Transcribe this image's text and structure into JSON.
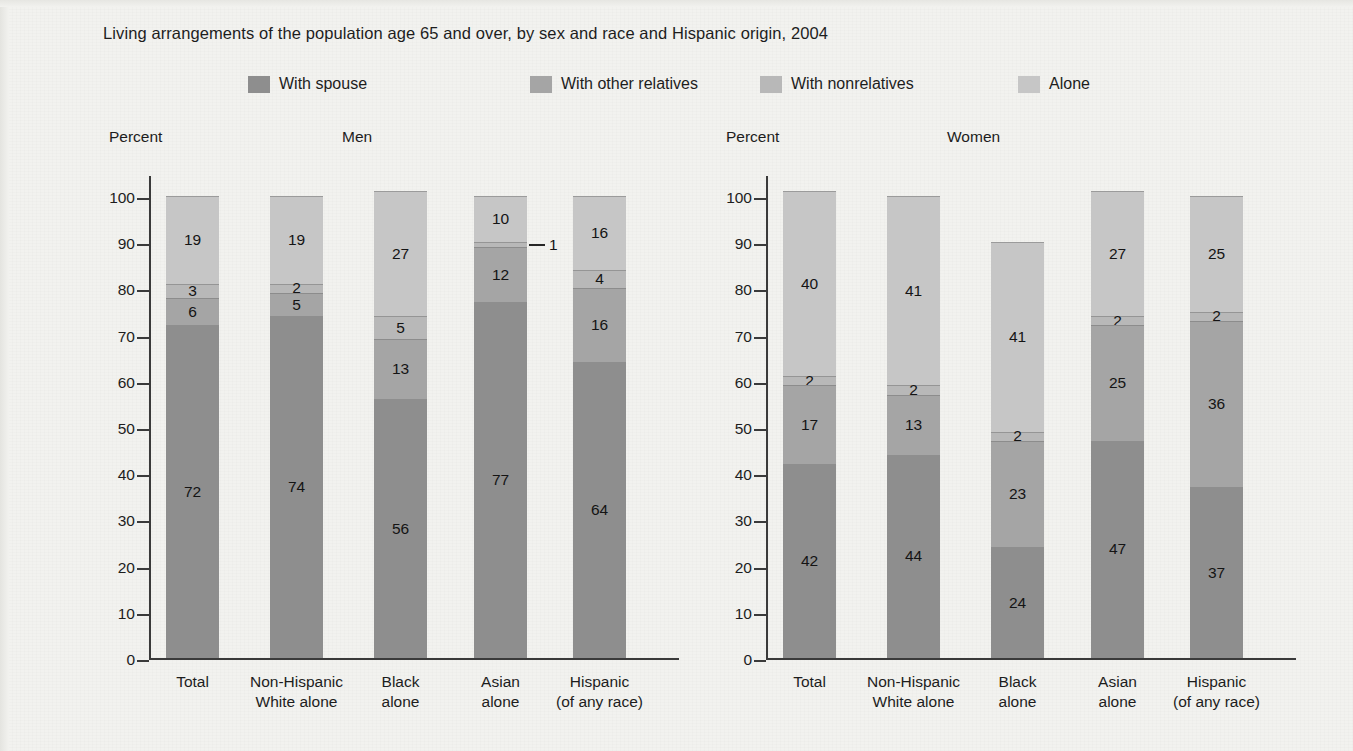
{
  "title": "Living arrangements of the population age 65 and over, by sex and race and Hispanic origin, 2004",
  "axis": {
    "y_title": "Percent",
    "y_ticks": [
      "0",
      "10",
      "20",
      "30",
      "40",
      "50",
      "60",
      "70",
      "80",
      "90",
      "100"
    ]
  },
  "panels": [
    {
      "key": "men",
      "label": "Men"
    },
    {
      "key": "women",
      "label": "Women"
    }
  ],
  "legend": {
    "items": [
      {
        "label": "With spouse",
        "color": "#8e8e8e",
        "icon": "legend-swatch"
      },
      {
        "label": "With other relatives",
        "color": "#a5a5a5",
        "icon": "legend-swatch"
      },
      {
        "label": "With nonrelatives",
        "color": "#b8b8b8",
        "icon": "legend-swatch"
      },
      {
        "label": "Alone",
        "color": "#c6c6c6",
        "icon": "legend-swatch"
      }
    ]
  },
  "chart_data": {
    "type": "bar",
    "title": "Living arrangements of the population age 65 and over, by sex and race and Hispanic origin, 2004",
    "xlabel": "",
    "ylabel": "Percent",
    "ylim": [
      0,
      100
    ],
    "grid": false,
    "stacked": true,
    "stack_order": "bottom-to-top",
    "legend_position": "top",
    "categories": [
      "Total",
      "Non-Hispanic\nWhite alone",
      "Black\nalone",
      "Asian\nalone",
      "Hispanic\n(of any race)"
    ],
    "panels": [
      {
        "name": "Men",
        "series": [
          {
            "name": "With spouse",
            "values": [
              72,
              74,
              56,
              77,
              64
            ]
          },
          {
            "name": "With other relatives",
            "values": [
              6,
              5,
              13,
              12,
              16
            ]
          },
          {
            "name": "With nonrelatives",
            "values": [
              3,
              2,
              5,
              1,
              4
            ]
          },
          {
            "name": "Alone",
            "values": [
              19,
              19,
              27,
              10,
              16
            ]
          }
        ]
      },
      {
        "name": "Women",
        "series": [
          {
            "name": "With spouse",
            "values": [
              42,
              44,
              24,
              47,
              37
            ]
          },
          {
            "name": "With other relatives",
            "values": [
              17,
              13,
              23,
              25,
              36
            ]
          },
          {
            "name": "With nonrelatives",
            "values": [
              2,
              2,
              2,
              2,
              2
            ]
          },
          {
            "name": "Alone",
            "values": [
              40,
              41,
              41,
              27,
              25
            ]
          }
        ]
      }
    ],
    "annotations": [
      {
        "panel": "Men",
        "category": "Asian\nalone",
        "series": "With nonrelatives",
        "text": "1",
        "style": "leader-line-right"
      }
    ]
  }
}
